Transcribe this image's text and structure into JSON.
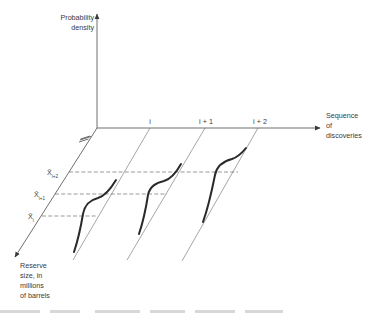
{
  "diagram": {
    "title": "",
    "axes": {
      "vertical": {
        "label_line1": "Probability",
        "label_line2": "density"
      },
      "horizontal": {
        "label_line1": "Sequence",
        "label_line2": "of",
        "label_line3": "discoveries"
      },
      "depth": {
        "label_line1": "Reserve",
        "label_line2": "size, in",
        "label_line3": "millions",
        "label_line4": "of barrels"
      }
    },
    "ticks": [
      {
        "label": "i"
      },
      {
        "label": "i + 1"
      },
      {
        "label": "i + 2"
      }
    ],
    "mean_markers": [
      {
        "symbol": "X̄",
        "subscript": "i"
      },
      {
        "symbol": "X̄",
        "subscript": "i+1"
      },
      {
        "symbol": "X̄",
        "subscript": "i+2"
      }
    ],
    "curves": [
      {
        "discovery": "i",
        "description": "cumulative-style density curve for discovery i"
      },
      {
        "discovery": "i + 1",
        "description": "cumulative-style density curve for discovery i+1"
      },
      {
        "discovery": "i + 2",
        "description": "cumulative-style density curve for discovery i+2"
      }
    ],
    "axis_break": "double-slash break mark on reserve-size axis",
    "colors": {
      "ink": "#3a3a3a",
      "curve": "#2a2a2a",
      "background": "#ffffff"
    }
  }
}
